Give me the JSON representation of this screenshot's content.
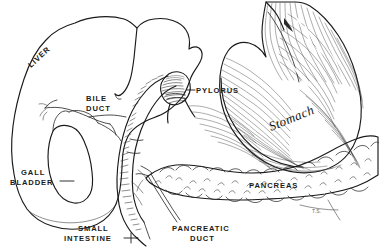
{
  "figure": {
    "background_color": "#ffffff",
    "ink_color": "#1a1a1a",
    "style": "pen-and-ink line engraving"
  },
  "labels": {
    "liver": "LIVER",
    "bile_duct_line1": "BILE",
    "bile_duct_line2": "DUCT",
    "gall_bladder_line1": "GALL",
    "gall_bladder_line2": "BLADDER",
    "small_intestine_line1": "SMALL",
    "small_intestine_line2": "INTESTINE",
    "pylorus": "PYLORUS",
    "stomach": "Stomach",
    "pancreas": "PANCREAS",
    "pancreatic_duct_line1": "PANCREATIC",
    "pancreatic_duct_line2": "DUCT",
    "artist_signature": "T.S."
  },
  "structures": [
    {
      "name": "liver",
      "label": "LIVER"
    },
    {
      "name": "gall-bladder",
      "label": "GALL BLADDER"
    },
    {
      "name": "bile-duct",
      "label": "BILE DUCT"
    },
    {
      "name": "duodenum-small-intestine",
      "label": "SMALL INTESTINE"
    },
    {
      "name": "pylorus",
      "label": "PYLORUS"
    },
    {
      "name": "stomach",
      "label": "Stomach"
    },
    {
      "name": "pancreas",
      "label": "PANCREAS"
    },
    {
      "name": "pancreatic-duct",
      "label": "PANCREATIC DUCT"
    }
  ]
}
